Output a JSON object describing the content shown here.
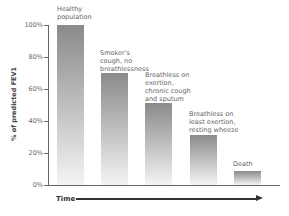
{
  "chart_data": {
    "type": "bar",
    "title": "",
    "xlabel": "Time",
    "ylabel": "% of predicted FEV1",
    "ylim": [
      0,
      100
    ],
    "yticks": [
      "0%",
      "20%",
      "40%",
      "60%",
      "80%",
      "100%"
    ],
    "grid": false,
    "categories": [
      "Healthy population",
      "Smoker's cough, no breathlessness",
      "Breathless on exertion, chronic cough and sputum",
      "Breathless on least exertion, resting wheeze",
      "Death"
    ],
    "labels_display": [
      "Healthy\npopulation",
      "Smoker's\ncough, no\nbreathlessness",
      "Breathless on\nexertion,\nchronic cough\nand sputum",
      "Breathless on\nleast exertion,\nresting wheeze",
      "Death"
    ],
    "values": [
      100,
      70,
      51,
      31,
      9
    ],
    "bar_color": "#8a8a8a"
  }
}
